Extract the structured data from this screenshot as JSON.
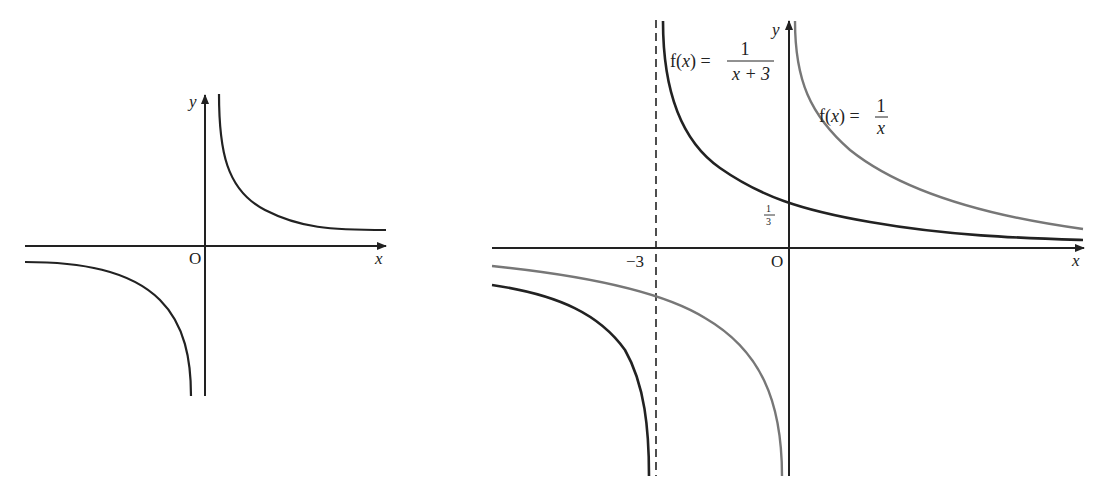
{
  "left_graph": {
    "y_axis_label": "y",
    "x_axis_label": "x",
    "origin_label": "O",
    "curve": "hyperbola (reciprocal shape)"
  },
  "right_graph": {
    "y_axis_label": "y",
    "x_axis_label": "x",
    "origin_label": "O",
    "asymptote_label": "−3",
    "intercept_label_num": "1",
    "intercept_label_den": "3",
    "curve1": {
      "prefix": "f(x) = ",
      "num": "1",
      "den": "x + 3",
      "color": "#222222"
    },
    "curve2": {
      "prefix": "f(x) = ",
      "num": "1",
      "den": "x",
      "color": "#777777"
    }
  },
  "colors": {
    "axis": "#222222",
    "dark_curve": "#222222",
    "grey_curve": "#777777"
  }
}
